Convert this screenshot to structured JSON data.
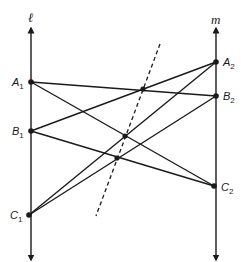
{
  "diagram": {
    "stroke_color": "#1a1a1a",
    "lines": {
      "l": {
        "label": "ℓ",
        "x": 31,
        "y_top": 30,
        "y_bottom": 258,
        "label_x": 28,
        "label_y": 22
      },
      "m": {
        "label": "m",
        "x": 216,
        "y_top": 30,
        "y_bottom": 258,
        "label_x": 211,
        "label_y": 24
      }
    },
    "points": [
      {
        "id": "A1",
        "base": "A",
        "sub": "1",
        "x": 31,
        "y": 82,
        "label_x": 12,
        "label_y": 86
      },
      {
        "id": "B1",
        "base": "B",
        "sub": "1",
        "x": 31,
        "y": 131,
        "label_x": 12,
        "label_y": 135
      },
      {
        "id": "C1",
        "base": "C",
        "sub": "1",
        "x": 29,
        "y": 215,
        "label_x": 10,
        "label_y": 219
      },
      {
        "id": "A2",
        "base": "A",
        "sub": "2",
        "x": 216,
        "y": 62,
        "label_x": 223,
        "label_y": 66
      },
      {
        "id": "B2",
        "base": "B",
        "sub": "2",
        "x": 216,
        "y": 96,
        "label_x": 223,
        "label_y": 100
      },
      {
        "id": "C2",
        "base": "C",
        "sub": "2",
        "x": 214,
        "y": 186,
        "label_x": 221,
        "label_y": 191
      }
    ],
    "segments": [
      {
        "from": "A1",
        "to": "B2"
      },
      {
        "from": "A1",
        "to": "C2"
      },
      {
        "from": "B1",
        "to": "A2"
      },
      {
        "from": "B1",
        "to": "C2"
      },
      {
        "from": "C1",
        "to": "A2"
      },
      {
        "from": "C1",
        "to": "B2"
      }
    ],
    "intersections": [
      {
        "id": "AB",
        "x": 143,
        "y": 89
      },
      {
        "id": "AC",
        "x": 125,
        "y": 136
      },
      {
        "id": "BC",
        "x": 117,
        "y": 158
      }
    ],
    "pappus_line": {
      "style": "dashed",
      "x1": 160,
      "y1": 44,
      "x2": 96,
      "y2": 216
    }
  }
}
